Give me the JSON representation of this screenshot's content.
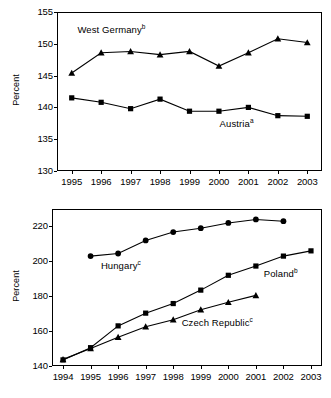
{
  "figure": {
    "axis_label": "Percent",
    "line_color": "#000000",
    "background": "#ffffff"
  },
  "chart_data": [
    {
      "type": "line",
      "panel": "top",
      "title": "",
      "xlabel": "",
      "ylabel": "Percent",
      "x": [
        "1995",
        "1996",
        "1997",
        "1998",
        "1999",
        "2000",
        "2001",
        "2002",
        "2003"
      ],
      "xlim": [
        1994.5,
        2003.5
      ],
      "ylim": [
        130,
        155
      ],
      "yticks": [
        130,
        135,
        140,
        145,
        150,
        155
      ],
      "grid": false,
      "legend": "inline-annotations",
      "series": [
        {
          "name": "West Germany",
          "footnote": "b",
          "marker": "triangle",
          "label_x_year": 1996.35,
          "label_y_value": 152.1,
          "x": [
            "1995",
            "1996",
            "1997",
            "1998",
            "1999",
            "2000",
            "2001",
            "2002",
            "2003"
          ],
          "values": [
            145.4,
            148.6,
            148.8,
            148.3,
            148.8,
            146.5,
            148.6,
            150.8,
            150.2
          ]
        },
        {
          "name": "Austria",
          "footnote": "a",
          "marker": "square",
          "label_x_year": 2000.6,
          "label_y_value": 137.4,
          "x": [
            "1995",
            "1996",
            "1997",
            "1998",
            "1999",
            "2000",
            "2001",
            "2002",
            "2003"
          ],
          "values": [
            141.5,
            140.8,
            139.8,
            141.3,
            139.4,
            139.4,
            140.0,
            138.7,
            138.6
          ]
        }
      ]
    },
    {
      "type": "line",
      "panel": "bottom",
      "title": "",
      "xlabel": "",
      "ylabel": "Percent",
      "x": [
        "1994",
        "1995",
        "1996",
        "1997",
        "1998",
        "1999",
        "2000",
        "2001",
        "2002",
        "2003"
      ],
      "xlim": [
        1993.6,
        2003.4
      ],
      "ylim": [
        140,
        230
      ],
      "yticks": [
        140,
        160,
        180,
        200,
        220
      ],
      "grid": false,
      "legend": "inline-annotations",
      "series": [
        {
          "name": "Hungary",
          "footnote": "c",
          "marker": "circle",
          "label_x_year": 1996.1,
          "label_y_value": 197.5,
          "x": [
            "1995",
            "1996",
            "1997",
            "1998",
            "1999",
            "2000",
            "2001",
            "2002"
          ],
          "values": [
            203.0,
            204.5,
            212.0,
            216.8,
            219.0,
            222.0,
            224.0,
            223.0
          ]
        },
        {
          "name": "Poland",
          "footnote": "b",
          "marker": "square",
          "label_x_year": 2001.9,
          "label_y_value": 192.5,
          "x": [
            "1994",
            "1995",
            "1996",
            "1997",
            "1998",
            "1999",
            "2000",
            "2001",
            "2002",
            "2003"
          ],
          "values": [
            143.5,
            150.5,
            163.0,
            170.3,
            175.8,
            183.5,
            192.0,
            197.3,
            203.0,
            206.0
          ]
        },
        {
          "name": "Czech Republic",
          "footnote": "c",
          "marker": "triangle",
          "label_x_year": 1999.6,
          "label_y_value": 164.5,
          "x": [
            "1994",
            "1995",
            "1996",
            "1997",
            "1998",
            "1999",
            "2000",
            "2001"
          ],
          "values": [
            143.8,
            150.0,
            156.5,
            162.5,
            166.5,
            172.3,
            176.5,
            180.5
          ]
        }
      ]
    }
  ]
}
